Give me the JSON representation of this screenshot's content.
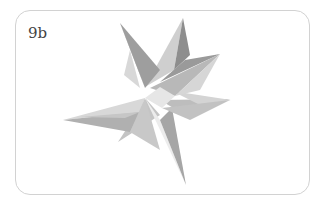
{
  "figure": {
    "label": "9b",
    "image_description": "origami eight-pointed star (3D paper model, gray)",
    "colors": {
      "frame_border": "#d2d2d2",
      "background": "#ffffff",
      "paper_light": "#dcdcdc",
      "paper_mid": "#b4b4b4",
      "paper_dark": "#8c8c8c"
    }
  }
}
